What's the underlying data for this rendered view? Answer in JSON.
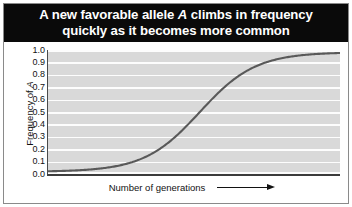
{
  "figure": {
    "title_line_1_before": "A new favorable allele ",
    "title_line_1_italic": "A",
    "title_line_1_after": " climbs in frequency",
    "title_line_2": "quickly as it becomes more common",
    "title_full": "A new favorable allele A climbs in frequency quickly as it becomes more common",
    "background_color": "#ffffff",
    "title_bar_color": "#0a0a0a",
    "title_text_color": "#ffffff",
    "border_color": "#8a8a8a"
  },
  "axes": {
    "y_title_before": "Frequency of ",
    "y_title_italic": "A",
    "y_title_full": "Frequency of A",
    "x_label": "Number of generations",
    "x_arrow_icon": "right-arrow-icon",
    "y_tick_labels": [
      "1.0",
      "0.9",
      "0.8",
      "0.7",
      "0.6",
      "0.5",
      "0.4",
      "0.3",
      "0.2",
      "0.1",
      "0.0"
    ],
    "plot_background_color": "#d9d9d9",
    "gridline_color": "#fdfdfd",
    "axis_line_color": "#3c3c3c",
    "curve_color": "#595959"
  },
  "chart_data": {
    "type": "line",
    "title": "A new favorable allele A climbs in frequency quickly as it becomes more common",
    "xlabel": "Number of generations",
    "ylabel": "Frequency of A",
    "xlim": [
      0,
      100
    ],
    "ylim": [
      0.0,
      1.0
    ],
    "grid": true,
    "legend": null,
    "y_ticks": [
      1.0,
      0.9,
      0.8,
      0.7,
      0.6,
      0.5,
      0.4,
      0.3,
      0.2,
      0.1,
      0.0
    ],
    "x_ticks": [],
    "series": [
      {
        "name": "Frequency of A",
        "curve": "logistic",
        "x": [
          0,
          5,
          10,
          15,
          20,
          25,
          30,
          35,
          40,
          45,
          50,
          55,
          60,
          65,
          70,
          75,
          80,
          85,
          90,
          95,
          100
        ],
        "values": [
          0.02,
          0.025,
          0.03,
          0.04,
          0.05,
          0.065,
          0.09,
          0.13,
          0.19,
          0.29,
          0.43,
          0.58,
          0.72,
          0.82,
          0.89,
          0.93,
          0.95,
          0.96,
          0.97,
          0.975,
          0.98
        ]
      }
    ]
  }
}
